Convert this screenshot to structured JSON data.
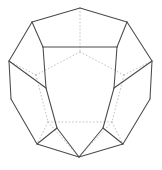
{
  "figure": {
    "shape_name": "regular dodecahedron",
    "background_color": "#ffffff",
    "visible_edge_color": "#4a4a4a",
    "hidden_edge_color": "#b9b9bd",
    "face_count": "12",
    "vertex_count": "20",
    "edge_count": "30"
  },
  "chart_data": {
    "type": "line",
    "xlabel": "",
    "ylabel": "",
    "xlim": [
      0,
      162
    ],
    "ylim": [
      0,
      170
    ],
    "grid": false,
    "legend": "none",
    "vertices": {
      "top_apex": [
        80,
        8
      ],
      "top_left": [
        32,
        22
      ],
      "top_right": [
        127,
        22
      ],
      "upper_mid_left": [
        43,
        47
      ],
      "upper_mid_right": [
        117,
        47
      ],
      "left_outer_upper": [
        9,
        61
      ],
      "right_outer_upper": [
        152,
        61
      ],
      "front_left": [
        46,
        88
      ],
      "front_right": [
        114,
        88
      ],
      "left_outer_lower": [
        11,
        99
      ],
      "right_outer_lower": [
        150,
        99
      ],
      "lower_left": [
        37,
        144
      ],
      "lower_right": [
        123,
        144
      ],
      "front_bottom_left": [
        57,
        128
      ],
      "front_bottom_right": [
        103,
        128
      ],
      "bottom_apex": [
        79,
        157
      ],
      "hidden_back_top": [
        80,
        52
      ],
      "hidden_back_left": [
        36,
        75
      ],
      "hidden_back_right": [
        124,
        75
      ],
      "hidden_back_lower_left": [
        48,
        122
      ],
      "hidden_back_lower_right": [
        112,
        122
      ]
    },
    "series": [
      {
        "name": "visible-edges",
        "style": "solid",
        "color": "#4a4a4a",
        "segments": [
          [
            [
              80,
              8
            ],
            [
              32,
              22
            ]
          ],
          [
            [
              80,
              8
            ],
            [
              127,
              22
            ]
          ],
          [
            [
              32,
              22
            ],
            [
              9,
              61
            ]
          ],
          [
            [
              127,
              22
            ],
            [
              152,
              61
            ]
          ],
          [
            [
              32,
              22
            ],
            [
              43,
              47
            ]
          ],
          [
            [
              127,
              22
            ],
            [
              117,
              47
            ]
          ],
          [
            [
              43,
              47
            ],
            [
              117,
              47
            ]
          ],
          [
            [
              43,
              47
            ],
            [
              46,
              88
            ]
          ],
          [
            [
              117,
              47
            ],
            [
              114,
              88
            ]
          ],
          [
            [
              9,
              61
            ],
            [
              11,
              99
            ]
          ],
          [
            [
              152,
              61
            ],
            [
              150,
              99
            ]
          ],
          [
            [
              9,
              61
            ],
            [
              46,
              88
            ]
          ],
          [
            [
              152,
              61
            ],
            [
              114,
              88
            ]
          ],
          [
            [
              46,
              88
            ],
            [
              57,
              128
            ]
          ],
          [
            [
              114,
              88
            ],
            [
              103,
              128
            ]
          ],
          [
            [
              11,
              99
            ],
            [
              37,
              144
            ]
          ],
          [
            [
              150,
              99
            ],
            [
              123,
              144
            ]
          ],
          [
            [
              57,
              128
            ],
            [
              37,
              144
            ]
          ],
          [
            [
              103,
              128
            ],
            [
              123,
              144
            ]
          ],
          [
            [
              57,
              128
            ],
            [
              79,
              157
            ]
          ],
          [
            [
              103,
              128
            ],
            [
              79,
              157
            ]
          ],
          [
            [
              37,
              144
            ],
            [
              79,
              157
            ]
          ],
          [
            [
              123,
              144
            ],
            [
              79,
              157
            ]
          ]
        ]
      },
      {
        "name": "hidden-edges",
        "style": "dotted",
        "color": "#b9b9bd",
        "segments": [
          [
            [
              80,
              8
            ],
            [
              80,
              52
            ]
          ],
          [
            [
              80,
              52
            ],
            [
              36,
              75
            ]
          ],
          [
            [
              80,
              52
            ],
            [
              124,
              75
            ]
          ],
          [
            [
              36,
              75
            ],
            [
              9,
              61
            ]
          ],
          [
            [
              124,
              75
            ],
            [
              152,
              61
            ]
          ],
          [
            [
              36,
              75
            ],
            [
              48,
              122
            ]
          ],
          [
            [
              124,
              75
            ],
            [
              112,
              122
            ]
          ],
          [
            [
              48,
              122
            ],
            [
              112,
              122
            ]
          ],
          [
            [
              48,
              122
            ],
            [
              37,
              144
            ]
          ],
          [
            [
              112,
              122
            ],
            [
              123,
              144
            ]
          ],
          [
            [
              48,
              122
            ],
            [
              79,
              157
            ]
          ],
          [
            [
              112,
              122
            ],
            [
              79,
              157
            ]
          ]
        ]
      }
    ]
  }
}
